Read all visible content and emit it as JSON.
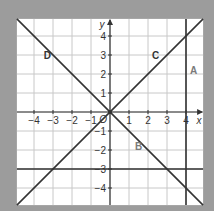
{
  "chart_data": {
    "type": "line",
    "title": "",
    "xlabel": "x",
    "ylabel": "y",
    "xlim": [
      -4.9,
      4.9
    ],
    "ylim": [
      -4.9,
      4.9
    ],
    "grid": true,
    "x_ticks": [
      -4,
      -3,
      -2,
      -1,
      1,
      2,
      3,
      4
    ],
    "y_ticks": [
      -4,
      -3,
      -2,
      -1,
      1,
      2,
      3,
      4
    ],
    "x_tick_labels": [
      "−4",
      "−3",
      "−2",
      "−1",
      "1",
      "2",
      "3",
      "4"
    ],
    "y_tick_labels": [
      "−4",
      "−3",
      "−2",
      "−1",
      "1",
      "2",
      "3",
      "4"
    ],
    "origin_label": "O",
    "series": [
      {
        "name": "A",
        "kind": "vertical",
        "equation": "x = 4",
        "x": 4,
        "label_at": [
          4.4,
          2
        ]
      },
      {
        "name": "B",
        "kind": "horizontal",
        "equation": "y = -3",
        "y": -3,
        "label_at": [
          1.5,
          -2
        ]
      },
      {
        "name": "C",
        "kind": "diagonal",
        "equation": "y = x",
        "slope": 1,
        "intercept": 0,
        "label_at": [
          2.4,
          2.8
        ]
      },
      {
        "name": "D",
        "kind": "diagonal",
        "equation": "y = -x",
        "slope": -1,
        "intercept": 0,
        "label_at": [
          -3.3,
          2.8
        ]
      }
    ],
    "colors": {
      "background": "#9c9c9c",
      "plot_bg": "#ffffff",
      "grid": "#c8c8c8",
      "axis": "#333333",
      "line": "#333333",
      "label": "#555555"
    }
  }
}
